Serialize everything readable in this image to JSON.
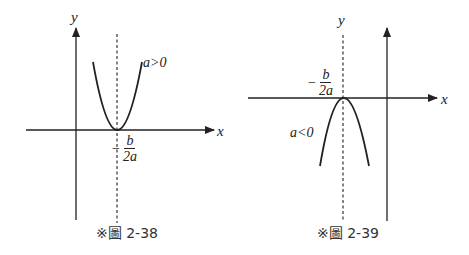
{
  "figures": [
    {
      "id": "2-38",
      "caption": "※圖 2-38",
      "x_axis_label": "x",
      "y_axis_label": "y",
      "curve_label": "a>0",
      "vertex_label": {
        "minus": "−",
        "numerator": "b",
        "denominator": "2a"
      },
      "opens": "up"
    },
    {
      "id": "2-39",
      "caption": "※圖 2-39",
      "x_axis_label": "x",
      "y_axis_label": "y",
      "curve_label": "a<0",
      "vertex_label": {
        "minus": "−",
        "numerator": "b",
        "denominator": "2a"
      },
      "opens": "down"
    }
  ]
}
